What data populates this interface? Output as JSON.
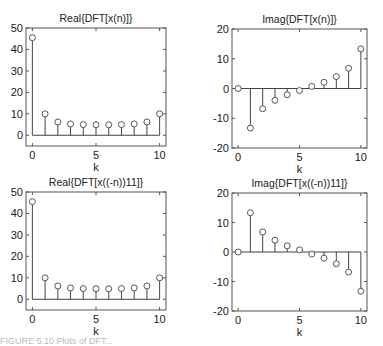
{
  "caption": "FIGURE 5.10  Plots of DFT...",
  "chart_data": [
    {
      "type": "stem",
      "title": "Real{DFT[x(n)]}",
      "xlabel": "k",
      "ylabel": "",
      "x": [
        0,
        1,
        2,
        3,
        4,
        5,
        6,
        7,
        8,
        9,
        10
      ],
      "values": [
        45.5,
        10.0,
        6.2,
        5.3,
        5.0,
        4.9,
        4.9,
        5.0,
        5.3,
        6.2,
        10.0
      ],
      "xlim": [
        -0.5,
        10.5
      ],
      "ylim": [
        -5,
        50
      ],
      "xticks": [
        0,
        5,
        10
      ],
      "yticks": [
        0,
        10,
        20,
        30,
        40,
        50
      ],
      "xticklabels": [
        "0",
        "5",
        "10"
      ],
      "yticklabels": [
        "0",
        "10",
        "20",
        "30",
        "40",
        "50"
      ],
      "grid": false
    },
    {
      "type": "stem",
      "title": "Imag{DFT[x(n)]}",
      "xlabel": "k",
      "ylabel": "",
      "x": [
        0,
        1,
        2,
        3,
        4,
        5,
        6,
        7,
        8,
        9,
        10
      ],
      "values": [
        0,
        -13.3,
        -6.8,
        -4.0,
        -2.1,
        -0.7,
        0.7,
        2.1,
        4.0,
        6.8,
        13.3
      ],
      "xlim": [
        -0.5,
        10.5
      ],
      "ylim": [
        -20,
        20
      ],
      "xticks": [
        0,
        5,
        10
      ],
      "yticks": [
        -20,
        -10,
        0,
        10,
        20
      ],
      "xticklabels": [
        "0",
        "5",
        "10"
      ],
      "yticklabels": [
        "-20",
        "-10",
        "0",
        "10",
        "20"
      ],
      "grid": false
    },
    {
      "type": "stem",
      "title": "Real{DFT[x((-n))11]}",
      "xlabel": "k",
      "ylabel": "",
      "x": [
        0,
        1,
        2,
        3,
        4,
        5,
        6,
        7,
        8,
        9,
        10
      ],
      "values": [
        45.5,
        10.0,
        6.2,
        5.3,
        5.0,
        4.9,
        4.9,
        5.0,
        5.3,
        6.2,
        10.0
      ],
      "xlim": [
        -0.5,
        10.5
      ],
      "ylim": [
        -5,
        50
      ],
      "xticks": [
        0,
        5,
        10
      ],
      "yticks": [
        0,
        10,
        20,
        30,
        40,
        50
      ],
      "xticklabels": [
        "0",
        "5",
        "10"
      ],
      "yticklabels": [
        "0",
        "10",
        "20",
        "30",
        "40",
        "50"
      ],
      "grid": false
    },
    {
      "type": "stem",
      "title": "Imag{DFT[x((-n))11]}",
      "xlabel": "k",
      "ylabel": "",
      "x": [
        0,
        1,
        2,
        3,
        4,
        5,
        6,
        7,
        8,
        9,
        10
      ],
      "values": [
        0,
        13.3,
        6.8,
        4.0,
        2.1,
        0.7,
        -0.7,
        -2.1,
        -4.0,
        -6.8,
        -13.3
      ],
      "xlim": [
        -0.5,
        10.5
      ],
      "ylim": [
        -20,
        20
      ],
      "xticks": [
        0,
        5,
        10
      ],
      "yticks": [
        -20,
        -10,
        0,
        10,
        20
      ],
      "xticklabels": [
        "0",
        "5",
        "10"
      ],
      "yticklabels": [
        "-20",
        "-10",
        "0",
        "10",
        "20"
      ],
      "grid": false
    }
  ]
}
